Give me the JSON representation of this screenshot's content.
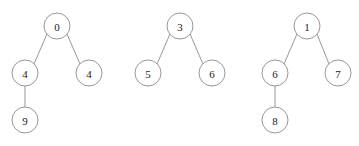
{
  "figure": {
    "title": "",
    "background_color": "#ffffff",
    "node_fill_color": "#ffffff",
    "node_stroke_color": "#8c8c8c",
    "edge_color": "#8c8c8c",
    "label_color": "#1a1a1a",
    "node_radius": 13,
    "width": 359,
    "height": 146
  },
  "chart_data": {
    "type": "diagram",
    "diagram_type": "binary-trees",
    "title": "",
    "xlabel": "",
    "ylabel": "",
    "grid": false,
    "legend": null,
    "trees": [
      {
        "name": "tree-1",
        "root_value": "0",
        "nodes": [
          {
            "id": "t1-n0",
            "label": "0",
            "cx": 57,
            "cy": 26,
            "r": 13,
            "role": "root"
          },
          {
            "id": "t1-n1",
            "label": "4",
            "cx": 25,
            "cy": 73,
            "r": 13,
            "role": "left-child"
          },
          {
            "id": "t1-n2",
            "label": "4",
            "cx": 89,
            "cy": 73,
            "r": 13,
            "role": "right-child"
          },
          {
            "id": "t1-n3",
            "label": "9",
            "cx": 25,
            "cy": 120,
            "r": 13,
            "role": "left-grandchild"
          }
        ],
        "edges": [
          {
            "from": "t1-n0",
            "to": "t1-n1",
            "x1": 47,
            "y1": 34,
            "x2": 34,
            "y2": 64
          },
          {
            "from": "t1-n0",
            "to": "t1-n2",
            "x1": 67,
            "y1": 34,
            "x2": 80,
            "y2": 64
          },
          {
            "from": "t1-n1",
            "to": "t1-n3",
            "x1": 25,
            "y1": 86,
            "x2": 25,
            "y2": 107
          }
        ]
      },
      {
        "name": "tree-2",
        "root_value": "3",
        "nodes": [
          {
            "id": "t2-n0",
            "label": "3",
            "cx": 180,
            "cy": 26,
            "r": 13,
            "role": "root"
          },
          {
            "id": "t2-n1",
            "label": "5",
            "cx": 148,
            "cy": 73,
            "r": 13,
            "role": "left-child"
          },
          {
            "id": "t2-n2",
            "label": "6",
            "cx": 212,
            "cy": 73,
            "r": 13,
            "role": "right-child"
          }
        ],
        "edges": [
          {
            "from": "t2-n0",
            "to": "t2-n1",
            "x1": 170,
            "y1": 34,
            "x2": 157,
            "y2": 64
          },
          {
            "from": "t2-n0",
            "to": "t2-n2",
            "x1": 190,
            "y1": 34,
            "x2": 203,
            "y2": 64
          }
        ]
      },
      {
        "name": "tree-3",
        "root_value": "1",
        "nodes": [
          {
            "id": "t3-n0",
            "label": "1",
            "cx": 307,
            "cy": 26,
            "r": 13,
            "role": "root"
          },
          {
            "id": "t3-n1",
            "label": "6",
            "cx": 275,
            "cy": 73,
            "r": 13,
            "role": "left-child"
          },
          {
            "id": "t3-n2",
            "label": "7",
            "cx": 338,
            "cy": 73,
            "r": 13,
            "role": "right-child"
          },
          {
            "id": "t3-n3",
            "label": "8",
            "cx": 275,
            "cy": 120,
            "r": 13,
            "role": "left-grandchild"
          }
        ],
        "edges": [
          {
            "from": "t3-n0",
            "to": "t3-n1",
            "x1": 297,
            "y1": 34,
            "x2": 284,
            "y2": 64
          },
          {
            "from": "t3-n0",
            "to": "t3-n2",
            "x1": 317,
            "y1": 34,
            "x2": 329,
            "y2": 64
          },
          {
            "from": "t3-n1",
            "to": "t3-n3",
            "x1": 275,
            "y1": 86,
            "x2": 275,
            "y2": 107
          }
        ]
      }
    ]
  }
}
